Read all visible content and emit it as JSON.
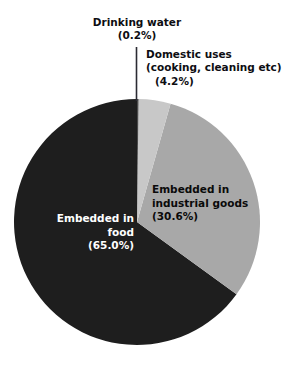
{
  "figure": {
    "title_cutoff": "",
    "background": "#ffffff"
  },
  "labels": {
    "drinking_water": {
      "name": "Drinking water",
      "percent_text": "(0.2%)"
    },
    "domestic_uses": {
      "name": "Domestic uses",
      "detail": "(cooking, cleaning etc)",
      "percent_text": "(4.2%)"
    },
    "industrial": {
      "line1": "Embedded in",
      "line2": "industrial goods",
      "percent_text": "(30.6%)"
    },
    "food": {
      "line1": "Embedded in",
      "line2": "food",
      "percent_text": "(65.0%)"
    }
  },
  "chart_data": {
    "type": "pie",
    "title": "",
    "xlabel": "",
    "ylabel": "",
    "start_angle_deg": 0,
    "direction": "clockwise",
    "center": {
      "cx": 137,
      "cy": 222
    },
    "radius": 123,
    "legend": "none",
    "grid": false,
    "categories": [
      "Drinking water",
      "Domestic uses (cooking, cleaning etc)",
      "Embedded in industrial goods",
      "Embedded in food"
    ],
    "values": [
      0.2,
      4.2,
      30.6,
      65.0
    ],
    "value_labels": [
      "(0.2%)",
      "(4.2%)",
      "(30.6%)",
      "(65.0%)"
    ],
    "units": "percent",
    "total": 100.0,
    "colors": [
      "#4a4a4a",
      "#c8c8c8",
      "#a8a8a8",
      "#1e1e1e"
    ],
    "label_placement": [
      "outside-leader",
      "outside",
      "inside",
      "inside"
    ],
    "slices": [
      {
        "label": "Drinking water",
        "value": 0.2,
        "value_label": "(0.2%)",
        "color": "#4a4a4a",
        "start_deg": 0.0,
        "end_deg": 0.72,
        "label_placement": "outside-leader",
        "label_color": "#0d0d12"
      },
      {
        "label": "Domestic uses (cooking, cleaning etc)",
        "value": 4.2,
        "value_label": "(4.2%)",
        "color": "#c8c8c8",
        "start_deg": 0.72,
        "end_deg": 15.84,
        "label_placement": "outside",
        "label_color": "#0d0d12"
      },
      {
        "label": "Embedded in industrial goods",
        "value": 30.6,
        "value_label": "(30.6%)",
        "color": "#a8a8a8",
        "start_deg": 15.84,
        "end_deg": 126.0,
        "label_placement": "inside",
        "label_color": "#0a0a0a"
      },
      {
        "label": "Embedded in food",
        "value": 65.0,
        "value_label": "(65.0%)",
        "color": "#1e1e1e",
        "start_deg": 126.0,
        "end_deg": 360.0,
        "label_placement": "inside",
        "label_color": "#ffffff"
      }
    ],
    "leader_line": {
      "for": "Drinking water",
      "x": 136,
      "y_top": 47,
      "y_bottom": 101,
      "color": "#2b2b33"
    }
  }
}
